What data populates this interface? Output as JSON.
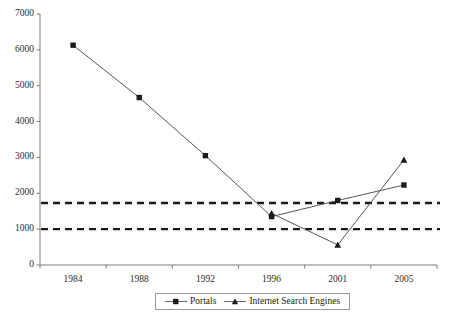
{
  "chart_data": {
    "type": "line",
    "title": "",
    "subtitle": "",
    "xlabel": "",
    "ylabel": "",
    "categories": [
      "1984",
      "1988",
      "1992",
      "1996",
      "2001",
      "2005"
    ],
    "ylim": [
      0,
      7000
    ],
    "y_ticks": [
      "0",
      "1000",
      "2000",
      "3000",
      "4000",
      "5000",
      "6000",
      "7000"
    ],
    "y_tick_values": [
      0,
      1000,
      2000,
      3000,
      4000,
      5000,
      6000,
      7000
    ],
    "grid": false,
    "legend_position": "bottom",
    "series": [
      {
        "name": "Portals",
        "marker": "square",
        "color": "#333333",
        "values": [
          6130,
          4670,
          3050,
          1350,
          1800,
          2230
        ]
      },
      {
        "name": "Internet Search Engines",
        "marker": "triangle",
        "color": "#333333",
        "values": [
          null,
          null,
          null,
          1440,
          560,
          2930
        ]
      }
    ],
    "reference_lines": [
      {
        "name": "upper-threshold",
        "value": 1730,
        "style": "dashed",
        "color": "#1a1a1a"
      },
      {
        "name": "lower-threshold",
        "value": 1000,
        "style": "dashed",
        "color": "#1a1a1a"
      }
    ]
  },
  "legend": {
    "items": [
      {
        "label": "Portals",
        "marker": "square-marker-icon"
      },
      {
        "label": "Internet Search Engines",
        "marker": "triangle-marker-icon"
      }
    ]
  },
  "colors": {
    "axis": "#7a7a7a",
    "series_line": "#555555",
    "marker": "#1a1a1a",
    "reference_line": "#1a1a1a",
    "text": "#1a1a1a",
    "background": "#ffffff"
  }
}
